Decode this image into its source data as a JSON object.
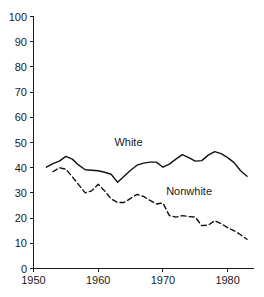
{
  "chart_data": {
    "type": "line",
    "title": "",
    "subtitle": "",
    "xlabel": "",
    "ylabel": "",
    "xlim": [
      1950,
      1984
    ],
    "ylim": [
      0,
      100
    ],
    "grid": false,
    "legend_position": "inline-annotation",
    "x_ticks": [
      "1950",
      "1960",
      "1970",
      "1980"
    ],
    "x_tick_values": [
      1950,
      1960,
      1970,
      1980
    ],
    "y_ticks": [
      "0",
      "10",
      "20",
      "30",
      "40",
      "50",
      "60",
      "70",
      "80",
      "90",
      "100"
    ],
    "y_tick_values": [
      0,
      10,
      20,
      30,
      40,
      50,
      60,
      70,
      80,
      90,
      100
    ],
    "series": [
      {
        "name": "White",
        "style": "solid",
        "color": "#111111",
        "label_x": 1962.5,
        "label_y": 48.5,
        "x": [
          1952,
          1953,
          1954,
          1955,
          1956,
          1957,
          1958,
          1959,
          1960,
          1961,
          1962,
          1963,
          1964,
          1965,
          1966,
          1967,
          1968,
          1969,
          1970,
          1971,
          1972,
          1973,
          1974,
          1975,
          1976,
          1977,
          1978,
          1979,
          1980,
          1981,
          1982,
          1983
        ],
        "values": [
          40.2,
          41.6,
          42.6,
          44.5,
          43.4,
          41.0,
          39.2,
          39.0,
          38.8,
          38.2,
          37.4,
          34.2,
          36.6,
          39.0,
          41.0,
          41.8,
          42.2,
          42.2,
          40.2,
          41.4,
          43.4,
          45.2,
          44.0,
          42.6,
          42.8,
          45.0,
          46.4,
          45.6,
          44.0,
          42.0,
          38.8,
          36.6
        ]
      },
      {
        "name": "Nonwhite",
        "style": "dashed",
        "color": "#111111",
        "label_x": 1970.5,
        "label_y": 29.0,
        "x": [
          1953,
          1954,
          1955,
          1956,
          1957,
          1958,
          1959,
          1960,
          1961,
          1962,
          1963,
          1964,
          1965,
          1966,
          1967,
          1968,
          1969,
          1970,
          1971,
          1972,
          1973,
          1974,
          1975,
          1976,
          1977,
          1978,
          1979,
          1980,
          1981,
          1982,
          1983
        ],
        "values": [
          38.4,
          40.0,
          39.4,
          36.4,
          33.2,
          30.0,
          30.8,
          33.4,
          30.8,
          27.6,
          26.2,
          26.2,
          27.8,
          29.4,
          28.6,
          27.0,
          25.6,
          26.0,
          21.0,
          20.4,
          21.0,
          20.6,
          20.4,
          17.0,
          17.2,
          19.0,
          17.8,
          16.2,
          15.0,
          13.4,
          11.6
        ]
      }
    ]
  },
  "axes": {
    "y_axis_name": "value-axis",
    "x_axis_name": "year-axis"
  }
}
